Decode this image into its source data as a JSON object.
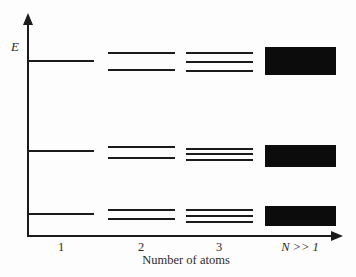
{
  "figure": {
    "background_color": "#fdfdfd",
    "ink_color": "#1b1b1b",
    "band_fill_color": "#0c0c0c",
    "y_axis": {
      "label": "E"
    },
    "x_axis": {
      "label": "Number of atoms",
      "ticks": [
        "1",
        "2",
        "3",
        "N >> 1"
      ]
    },
    "geometry": {
      "axis_origin": {
        "x": 28,
        "y": 236
      },
      "y_axis_top": 14,
      "x_axis_right": 342,
      "columns": [
        {
          "x1": 28,
          "x2": 94,
          "center": 61
        },
        {
          "x1": 108,
          "x2": 175,
          "center": 141
        },
        {
          "x1": 186,
          "x2": 253,
          "center": 219
        },
        {
          "x1": 265,
          "x2": 336,
          "center": 300
        }
      ],
      "level_groups": [
        {
          "name": "upper-level",
          "lines_by_column": [
            [
              61
            ],
            [
              53,
              70
            ],
            [
              53,
              62,
              71
            ]
          ],
          "band": {
            "y1": 47,
            "y2": 75
          }
        },
        {
          "name": "middle-level",
          "lines_by_column": [
            [
              151
            ],
            [
              147,
              158
            ],
            [
              149,
              154,
              160
            ]
          ],
          "band": {
            "y1": 145,
            "y2": 167
          }
        },
        {
          "name": "lower-level",
          "lines_by_column": [
            [
              214
            ],
            [
              210,
              219
            ],
            [
              210,
              216,
              222
            ]
          ],
          "band": {
            "y1": 206,
            "y2": 226
          }
        }
      ]
    }
  }
}
